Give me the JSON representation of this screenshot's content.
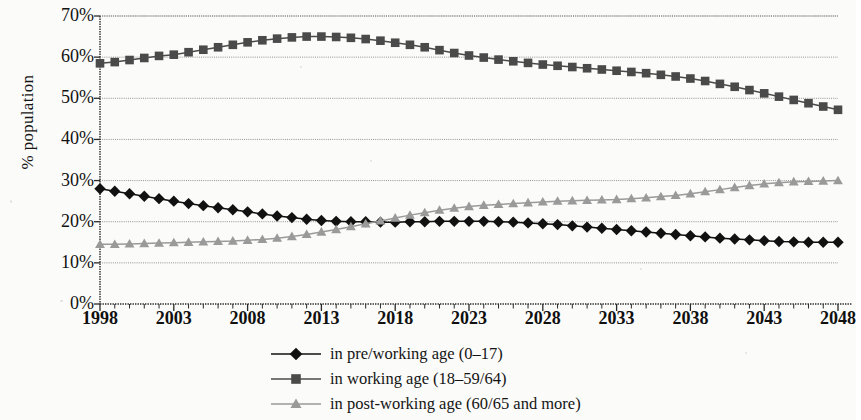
{
  "figure": {
    "background": "#fbfbf9",
    "axis_color": "#2a2a2a",
    "grid_color": "#8d8d8d"
  },
  "axes": {
    "y_title": "% population",
    "y_ticks": [
      "70%",
      "60%",
      "50%",
      "40%",
      "30%",
      "20%",
      "10%",
      "0%"
    ],
    "x_ticks": [
      "1998",
      "2003",
      "2008",
      "2013",
      "2018",
      "2023",
      "2028",
      "2033",
      "2038",
      "2043",
      "2048"
    ]
  },
  "legend": {
    "items": [
      {
        "label": "in pre/working age (0–17)",
        "marker": "diamond",
        "color": "#111111"
      },
      {
        "label": "in working age (18–59/64)",
        "marker": "square",
        "color": "#4a4a4a"
      },
      {
        "label": "in post-working age (60/65 and more)",
        "marker": "triangle",
        "color": "#9a9a9a"
      }
    ]
  },
  "chart_data": {
    "type": "line",
    "title": "",
    "xlabel": "",
    "ylabel": "% population",
    "xlim": [
      1998,
      2048
    ],
    "ylim": [
      0,
      70
    ],
    "y_tick_values": [
      0,
      10,
      20,
      30,
      40,
      50,
      60,
      70
    ],
    "x_tick_values": [
      1998,
      2003,
      2008,
      2013,
      2018,
      2023,
      2028,
      2033,
      2038,
      2043,
      2048
    ],
    "y_unit": "percent",
    "grid": true,
    "legend_position": "bottom",
    "x": [
      1998,
      1999,
      2000,
      2001,
      2002,
      2003,
      2004,
      2005,
      2006,
      2007,
      2008,
      2009,
      2010,
      2011,
      2012,
      2013,
      2014,
      2015,
      2016,
      2017,
      2018,
      2019,
      2020,
      2021,
      2022,
      2023,
      2024,
      2025,
      2026,
      2027,
      2028,
      2029,
      2030,
      2031,
      2032,
      2033,
      2034,
      2035,
      2036,
      2037,
      2038,
      2039,
      2040,
      2041,
      2042,
      2043,
      2044,
      2045,
      2046,
      2047,
      2048
    ],
    "series": [
      {
        "name": "in pre/working age (0–17)",
        "marker": "diamond",
        "color": "#111111",
        "values": [
          28.0,
          27.4,
          26.8,
          26.2,
          25.6,
          25.0,
          24.4,
          23.9,
          23.4,
          22.9,
          22.4,
          21.9,
          21.4,
          21.0,
          20.6,
          20.3,
          20.1,
          20.0,
          20.0,
          19.9,
          19.9,
          20.0,
          20.0,
          20.1,
          20.1,
          20.1,
          20.1,
          20.0,
          19.9,
          19.7,
          19.5,
          19.3,
          19.0,
          18.7,
          18.4,
          18.1,
          17.8,
          17.5,
          17.2,
          16.9,
          16.6,
          16.3,
          16.0,
          15.8,
          15.6,
          15.4,
          15.2,
          15.1,
          15.0,
          15.0,
          15.0
        ]
      },
      {
        "name": "in working age (18–59/64)",
        "marker": "square",
        "color": "#4a4a4a",
        "values": [
          58.5,
          58.8,
          59.3,
          59.8,
          60.3,
          60.6,
          61.2,
          61.8,
          62.4,
          63.0,
          63.6,
          64.1,
          64.5,
          64.8,
          65.0,
          65.0,
          64.9,
          64.7,
          64.4,
          64.0,
          63.5,
          63.0,
          62.4,
          61.7,
          61.0,
          60.4,
          59.9,
          59.4,
          59.0,
          58.6,
          58.2,
          57.9,
          57.6,
          57.3,
          57.0,
          56.7,
          56.4,
          56.1,
          55.7,
          55.3,
          54.8,
          54.2,
          53.5,
          52.8,
          52.0,
          51.2,
          50.4,
          49.6,
          48.8,
          48.0,
          47.2
        ]
      },
      {
        "name": "in post-working age (60/65 and more)",
        "marker": "triangle",
        "color": "#9a9a9a",
        "values": [
          14.5,
          14.5,
          14.6,
          14.7,
          14.8,
          14.9,
          15.0,
          15.1,
          15.2,
          15.3,
          15.5,
          15.7,
          16.0,
          16.4,
          16.9,
          17.5,
          18.1,
          18.8,
          19.5,
          20.2,
          20.9,
          21.6,
          22.2,
          22.8,
          23.3,
          23.7,
          24.0,
          24.2,
          24.4,
          24.6,
          24.8,
          25.0,
          25.1,
          25.2,
          25.3,
          25.4,
          25.6,
          25.8,
          26.1,
          26.4,
          26.8,
          27.3,
          27.8,
          28.3,
          28.8,
          29.2,
          29.5,
          29.7,
          29.8,
          29.9,
          30.0
        ]
      }
    ]
  }
}
